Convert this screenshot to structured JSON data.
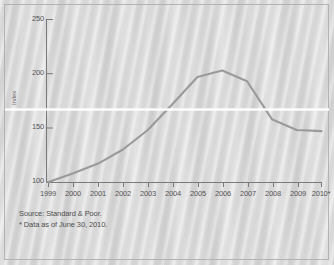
{
  "figure": {
    "background_color": "#d8d8d8",
    "border_color": "#b3b3b3",
    "line_color": "#9a9a9a",
    "axis_color": "#7a7a7a",
    "text_color": "#555555",
    "band_color": "#ffffff"
  },
  "footnotes": {
    "source": "Source: Standard & Poor.",
    "note": "* Data as of June 30, 2010."
  },
  "chart_data": {
    "type": "line",
    "title": "",
    "subtitle": "",
    "xlabel": "",
    "ylabel": "Index",
    "legend": [],
    "legend_position": "none",
    "grid": false,
    "xlim": [
      "1999",
      "2010*"
    ],
    "ylim": [
      100,
      250
    ],
    "yticks": [
      100,
      150,
      200,
      250
    ],
    "ytick_labels": [
      "100",
      "150",
      "200",
      "250"
    ],
    "categories": [
      "1999",
      "2000",
      "2001",
      "2002",
      "2003",
      "2004",
      "2005",
      "2006",
      "2007",
      "2008",
      "2009",
      "2010*"
    ],
    "xtick_labels": [
      "1999",
      "2000",
      "2001",
      "2002",
      "2003",
      "2004",
      "2005",
      "2006",
      "2007",
      "2008",
      "2009",
      "2010*"
    ],
    "series": [
      {
        "name": "Home price index",
        "color": "#9a9a9a",
        "values": [
          100,
          108,
          117,
          130,
          148,
          172,
          197,
          203,
          193,
          158,
          148,
          147
        ]
      }
    ],
    "annotations": [
      {
        "name": "reference-band",
        "type": "hline",
        "value": 167,
        "color": "#ffffff"
      }
    ]
  }
}
